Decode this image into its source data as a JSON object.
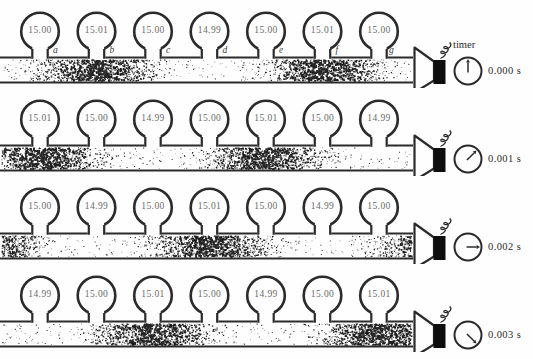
{
  "timer_label": "timer",
  "gauge_letters": [
    "a",
    "b",
    "c",
    "d",
    "e",
    "f",
    "g"
  ],
  "colors": {
    "ink": "#2b2b2b",
    "reading_text": "#6a6a6a",
    "driver_black": "#0e0e0e",
    "stipple": "#161616",
    "background": "#fefefe"
  },
  "wave": {
    "wavelength_px": 226,
    "gauge_centers_px": [
      40,
      96.5,
      153,
      209.5,
      266,
      322.5,
      379
    ],
    "tube_x_end_px": 413,
    "tube_y_top_px": 57.5,
    "tube_y_bottom_px": 82.5,
    "shift_per_step_px": -56.5
  },
  "rows": [
    {
      "time": "0.000 s",
      "clock_angle_deg": 0,
      "compression_phase_px": 96.5,
      "readings": [
        "15.00",
        "15.01",
        "15.00",
        "14.99",
        "15.00",
        "15.01",
        "15.00"
      ]
    },
    {
      "time": "0.001 s",
      "clock_angle_deg": 45,
      "compression_phase_px": 40,
      "readings": [
        "15.01",
        "15.00",
        "14.99",
        "15.00",
        "15.01",
        "15.00",
        "14.99"
      ]
    },
    {
      "time": "0.002 s",
      "clock_angle_deg": 90,
      "compression_phase_px": -16.5,
      "readings": [
        "15.00",
        "14.99",
        "15.00",
        "15.01",
        "15.00",
        "14.99",
        "15.00"
      ]
    },
    {
      "time": "0.003 s",
      "clock_angle_deg": 135,
      "compression_phase_px": -73,
      "readings": [
        "14.99",
        "15.00",
        "15.01",
        "15.00",
        "14.99",
        "15.00",
        "15.01"
      ]
    }
  ]
}
